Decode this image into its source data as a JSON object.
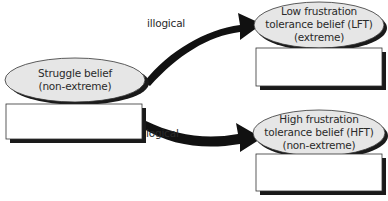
{
  "diagram": {
    "nodes": [
      {
        "id": "struggle",
        "lines": [
          "Struggle belief",
          "(non-extreme)"
        ],
        "has_empty_box": true
      },
      {
        "id": "lft",
        "lines": [
          "Low frustration",
          "tolerance belief (LFT)",
          "(extreme)"
        ],
        "has_empty_box": true
      },
      {
        "id": "hft",
        "lines": [
          "High frustration",
          "tolerance belief (HFT)",
          "(non-extreme)"
        ],
        "has_empty_box": true
      }
    ],
    "edges": [
      {
        "from": "struggle",
        "to": "lft",
        "label": "illogical"
      },
      {
        "from": "struggle",
        "to": "hft",
        "label": "logical"
      }
    ]
  },
  "colors": {
    "ellipse_fill": "#e6e6e6",
    "shadow": "#1a1a1a",
    "arrow": "#111111",
    "box_fill": "#ffffff"
  }
}
